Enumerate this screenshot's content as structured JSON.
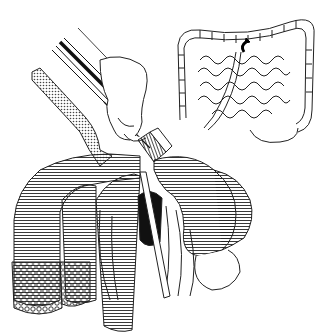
{
  "figure": {
    "page_mark": "",
    "colors": {
      "ink": "#1a1a1a",
      "paper": "#ffffff",
      "shade": "#8c8c8c"
    },
    "inset": {
      "subject": "intestinal-tract-overview",
      "marker": "curved-arrow"
    },
    "main": {
      "subject": "colon-with-endoscopic-instrument",
      "elements": [
        "hand",
        "endoscope",
        "tubing",
        "colon",
        "mesentery"
      ]
    }
  }
}
